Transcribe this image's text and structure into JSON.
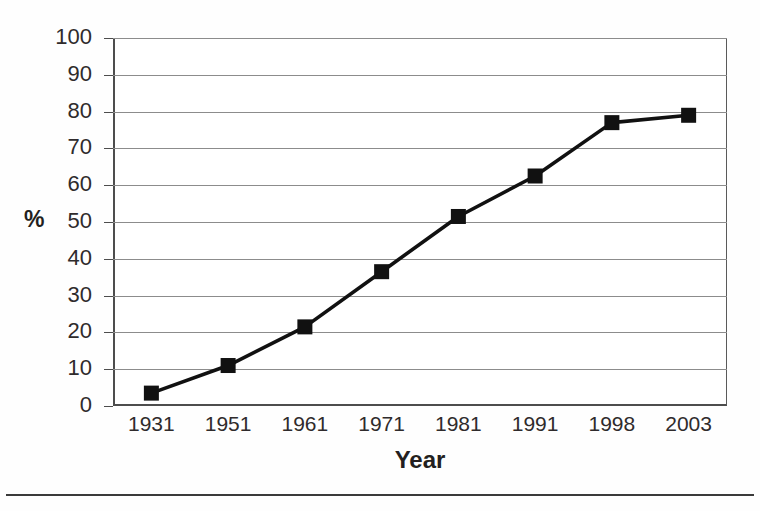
{
  "figure": {
    "background_color": "#fefefe",
    "plot_background_color": "#ffffff",
    "axis_color": "#4d4d4d",
    "gridline_color": "#8c8c8c",
    "series_color": "#111111",
    "bottom_rule": true
  },
  "axes": {
    "y_axis_title": "%",
    "x_axis_title": "Year"
  },
  "chart_data": {
    "type": "line",
    "title": "",
    "subtitle": "",
    "xlabel": "Year",
    "ylabel": "%",
    "categories": [
      "1931",
      "1951",
      "1961",
      "1971",
      "1981",
      "1991",
      "1998",
      "2003"
    ],
    "values": [
      3.5,
      11,
      21.5,
      36.5,
      51.5,
      62.5,
      77,
      79
    ],
    "series": [
      {
        "name": "",
        "values": [
          3.5,
          11,
          21.5,
          36.5,
          51.5,
          62.5,
          77,
          79
        ],
        "marker": "square",
        "marker_color": "#111111",
        "line_color": "#111111"
      }
    ],
    "ylim": [
      0,
      100
    ],
    "ytick_values": [
      0,
      10,
      20,
      30,
      40,
      50,
      60,
      70,
      80,
      90,
      100
    ],
    "ytick_labels": [
      "0",
      "10",
      "20",
      "30",
      "40",
      "50",
      "60",
      "70",
      "80",
      "90",
      "100"
    ],
    "xtick_labels": [
      "1931",
      "1951",
      "1961",
      "1971",
      "1981",
      "1991",
      "1998",
      "2003"
    ],
    "grid": "horizontal",
    "grid_on": true,
    "legend": false,
    "legend_position": "none",
    "annotations": []
  }
}
